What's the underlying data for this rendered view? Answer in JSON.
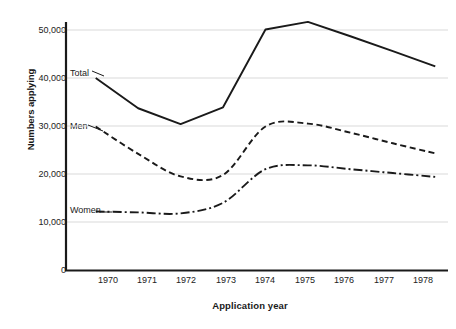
{
  "chart_data": {
    "type": "line",
    "title": "",
    "xlabel": "Application year",
    "ylabel": "Numbers applying",
    "x": [
      1970,
      1971,
      1972,
      1973,
      1974,
      1975,
      1976,
      1977,
      1978
    ],
    "categories": [
      "1970",
      "1971",
      "1972",
      "1973",
      "1974",
      "1975",
      "1976",
      "1977",
      "1978"
    ],
    "xlim": [
      1969.3,
      1978.3
    ],
    "ylim": [
      0,
      52500
    ],
    "y_ticks": [
      0,
      10000,
      20000,
      30000,
      40000,
      50000
    ],
    "y_tick_labels": [
      "0",
      "10,000",
      "20,000",
      "30,000",
      "40,000",
      "50,000"
    ],
    "grid": "horizontal",
    "legend_position": "inline-left",
    "series": [
      {
        "name": "Total",
        "line_style": "solid",
        "color": "#1a1a1a",
        "values": [
          40000,
          33700,
          30400,
          33900,
          50100,
          51700,
          48700,
          45600,
          42400
        ]
      },
      {
        "name": "Men",
        "line_style": "dashed",
        "color": "#1a1a1a",
        "values": [
          29900,
          24200,
          19500,
          19800,
          29900,
          30500,
          28600,
          26400,
          24300
        ]
      },
      {
        "name": "Women",
        "line_style": "dash-dot",
        "color": "#1a1a1a",
        "values": [
          12200,
          12000,
          11800,
          14000,
          21000,
          21800,
          21000,
          20200,
          19400
        ]
      }
    ]
  },
  "axis": {
    "x_title": "Application year",
    "y_title": "Numbers applying"
  },
  "y_labels": {
    "t0": "0",
    "t1": "10,000",
    "t2": "20,000",
    "t3": "30,000",
    "t4": "40,000",
    "t5": "50,000"
  },
  "x_labels": {
    "x0": "1970",
    "x1": "1971",
    "x2": "1972",
    "x3": "1973",
    "x4": "1974",
    "x5": "1975",
    "x6": "1976",
    "x7": "1977",
    "x8": "1978"
  },
  "series_labels": {
    "total": "Total",
    "men": "Men",
    "women": "Women"
  },
  "colors": {
    "line": "#1a1a1a",
    "grid": "#d9d9d9",
    "axis": "#1a1a1a",
    "background": "#ffffff"
  }
}
